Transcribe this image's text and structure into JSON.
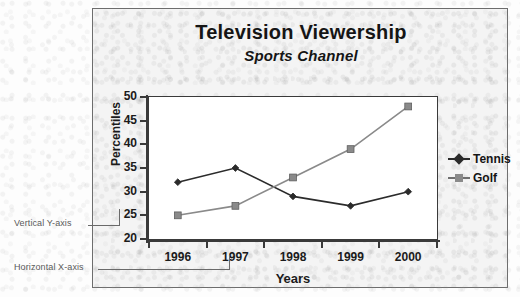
{
  "figure": {
    "title": "Television Viewership",
    "subtitle": "Sports Channel"
  },
  "annotations": {
    "y_axis_callout": "Vertical Y-axis",
    "x_axis_callout": "Horizontal X-axis"
  },
  "colors": {
    "tennis": "#2b2b2b",
    "golf": "#8a8a8a",
    "axis": "#3a3a3a",
    "frame": "#6d6d6d",
    "plot_background": "#ffffff",
    "page_background": "#f4f4f4",
    "callout": "#5a5a5a"
  },
  "chart_data": {
    "type": "line",
    "title": "Television Viewership",
    "subtitle": "Sports Channel",
    "xlabel": "Years",
    "ylabel": "Percentiles",
    "categories": [
      "1996",
      "1997",
      "1998",
      "1999",
      "2000"
    ],
    "ylim": [
      20,
      50
    ],
    "yticks": [
      20,
      25,
      30,
      35,
      40,
      45,
      50
    ],
    "grid": false,
    "legend_position": "right",
    "series": [
      {
        "name": "Tennis",
        "marker": "diamond",
        "color": "#2b2b2b",
        "values": [
          32,
          35,
          29,
          27,
          30
        ]
      },
      {
        "name": "Golf",
        "marker": "square",
        "color": "#8a8a8a",
        "values": [
          25,
          27,
          33,
          39,
          48
        ]
      }
    ]
  }
}
